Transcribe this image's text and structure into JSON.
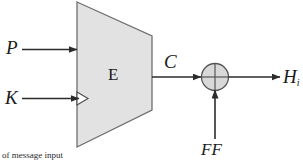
{
  "diagram": {
    "caption": "of message input",
    "colors": {
      "background": "#ffffff",
      "block_fill": "#e2e2e2",
      "block_stroke": "#6f6f6f",
      "xor_fill": "#d9d9d9",
      "xor_stroke": "#555555",
      "line": "#2b2b2b"
    },
    "nodes": [
      {
        "id": "encrypt-block",
        "shape": "trapezoid",
        "label": "E"
      },
      {
        "id": "xor-gate",
        "shape": "circle-cross",
        "label": ""
      }
    ],
    "labels": {
      "plaintext_input": "P",
      "key_input": "K",
      "block_name": "E",
      "cipher_output": "C",
      "feed_forward": "FF",
      "hash_output": "H",
      "hash_output_subscript": "i"
    },
    "edges": [
      {
        "id": "p-to-block",
        "from": "P",
        "to": "encrypt-block",
        "label": "P"
      },
      {
        "id": "k-to-block",
        "from": "K",
        "to": "encrypt-block",
        "label": "K"
      },
      {
        "id": "block-to-xor",
        "from": "encrypt-block",
        "to": "xor-gate",
        "label": "C"
      },
      {
        "id": "ff-to-xor",
        "from": "FF",
        "to": "xor-gate",
        "label": "FF"
      },
      {
        "id": "xor-to-h",
        "from": "xor-gate",
        "to": "H",
        "label": "H"
      }
    ]
  }
}
